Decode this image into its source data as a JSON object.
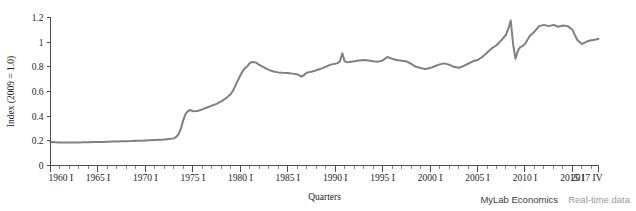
{
  "figure": {
    "credit_main": "MyLab Economics",
    "credit_sub": "Real-time data"
  },
  "chart_data": {
    "type": "line",
    "title": "",
    "xlabel": "Quarters",
    "ylabel": "Index (2009 = 1.0)",
    "xlim": [
      1960.0,
      2017.75
    ],
    "ylim": [
      0,
      1.2
    ],
    "grid": false,
    "legend": null,
    "y_ticks": [
      0,
      0.2,
      0.4,
      0.6,
      0.8,
      1,
      1.2
    ],
    "y_tick_labels": [
      "0",
      "0.2",
      "0.4",
      "0.6",
      "0.8",
      "1",
      "1.2"
    ],
    "x_ticks": [
      1960,
      1965,
      1970,
      1975,
      1980,
      1985,
      1990,
      1995,
      2000,
      2005,
      2010,
      2015,
      2017.75
    ],
    "x_tick_labels": [
      "1960 I",
      "1965 I",
      "1970 I",
      "1975 I",
      "1980 I",
      "1985 I",
      "1990 I",
      "1995 I",
      "2000 I",
      "2005 I",
      "2010 I",
      "2015 I",
      "2017 IV"
    ],
    "x_minor_step": 1,
    "line_color": "#808080",
    "series": [
      {
        "name": "Index (2009 = 1.0)",
        "x": [
          1960.0,
          1960.5,
          1961.0,
          1961.5,
          1962.0,
          1962.5,
          1963.0,
          1963.5,
          1964.0,
          1964.5,
          1965.0,
          1965.5,
          1966.0,
          1966.5,
          1967.0,
          1967.5,
          1968.0,
          1968.5,
          1969.0,
          1969.5,
          1970.0,
          1970.5,
          1971.0,
          1971.5,
          1972.0,
          1972.5,
          1973.0,
          1973.25,
          1973.5,
          1973.75,
          1974.0,
          1974.25,
          1974.5,
          1974.75,
          1975.0,
          1975.5,
          1976.0,
          1976.5,
          1977.0,
          1977.5,
          1978.0,
          1978.5,
          1979.0,
          1979.25,
          1979.5,
          1979.75,
          1980.0,
          1980.25,
          1980.5,
          1980.75,
          1981.0,
          1981.25,
          1981.5,
          1981.75,
          1982.0,
          1982.5,
          1983.0,
          1983.5,
          1984.0,
          1984.5,
          1985.0,
          1985.5,
          1986.0,
          1986.25,
          1986.5,
          1986.75,
          1987.0,
          1987.5,
          1988.0,
          1988.5,
          1989.0,
          1989.5,
          1990.0,
          1990.25,
          1990.5,
          1990.75,
          1991.0,
          1991.25,
          1991.5,
          1992.0,
          1992.5,
          1993.0,
          1993.5,
          1994.0,
          1994.5,
          1995.0,
          1995.5,
          1996.0,
          1996.5,
          1997.0,
          1997.5,
          1998.0,
          1998.5,
          1999.0,
          1999.5,
          2000.0,
          2000.5,
          2001.0,
          2001.5,
          2002.0,
          2002.5,
          2003.0,
          2003.5,
          2004.0,
          2004.5,
          2005.0,
          2005.5,
          2006.0,
          2006.5,
          2007.0,
          2007.5,
          2008.0,
          2008.25,
          2008.5,
          2008.75,
          2009.0,
          2009.25,
          2009.5,
          2009.75,
          2010.0,
          2010.5,
          2011.0,
          2011.5,
          2012.0,
          2012.5,
          2013.0,
          2013.5,
          2014.0,
          2014.5,
          2015.0,
          2015.5,
          2016.0,
          2016.5,
          2017.0,
          2017.5,
          2017.75
        ],
        "y": [
          0.19,
          0.188,
          0.186,
          0.186,
          0.186,
          0.187,
          0.187,
          0.188,
          0.189,
          0.19,
          0.19,
          0.191,
          0.193,
          0.194,
          0.195,
          0.196,
          0.197,
          0.198,
          0.2,
          0.201,
          0.203,
          0.205,
          0.207,
          0.209,
          0.211,
          0.214,
          0.22,
          0.232,
          0.255,
          0.3,
          0.37,
          0.42,
          0.442,
          0.45,
          0.44,
          0.442,
          0.455,
          0.47,
          0.485,
          0.5,
          0.52,
          0.545,
          0.58,
          0.61,
          0.65,
          0.69,
          0.73,
          0.765,
          0.79,
          0.805,
          0.83,
          0.84,
          0.838,
          0.83,
          0.815,
          0.795,
          0.775,
          0.762,
          0.755,
          0.752,
          0.75,
          0.745,
          0.74,
          0.728,
          0.722,
          0.735,
          0.752,
          0.76,
          0.772,
          0.785,
          0.8,
          0.818,
          0.825,
          0.83,
          0.845,
          0.91,
          0.845,
          0.838,
          0.84,
          0.845,
          0.852,
          0.855,
          0.852,
          0.845,
          0.842,
          0.852,
          0.88,
          0.865,
          0.855,
          0.85,
          0.845,
          0.825,
          0.8,
          0.79,
          0.782,
          0.79,
          0.805,
          0.82,
          0.828,
          0.818,
          0.8,
          0.792,
          0.805,
          0.825,
          0.845,
          0.855,
          0.88,
          0.915,
          0.95,
          0.975,
          1.015,
          1.06,
          1.11,
          1.175,
          0.985,
          0.865,
          0.93,
          0.96,
          0.968,
          0.985,
          1.05,
          1.085,
          1.13,
          1.14,
          1.13,
          1.14,
          1.125,
          1.135,
          1.13,
          1.1,
          1.02,
          0.985,
          1.005,
          1.015,
          1.022,
          1.028
        ]
      }
    ]
  }
}
